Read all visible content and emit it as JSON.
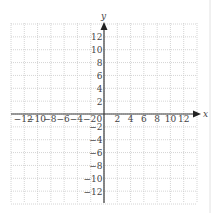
{
  "chart_data": {
    "type": "coordinate-grid",
    "title": "",
    "xlabel": "x",
    "ylabel": "y",
    "xlim": [
      -14,
      14
    ],
    "ylim": [
      -14,
      14
    ],
    "grid": true,
    "grid_step": 2,
    "x_ticks": [
      -12,
      -10,
      -8,
      -6,
      -4,
      -2,
      0,
      2,
      4,
      6,
      8,
      10,
      12
    ],
    "y_ticks": [
      -12,
      -10,
      -8,
      -6,
      -4,
      -2,
      2,
      4,
      6,
      8,
      10,
      12
    ],
    "x_tick_labels": [
      "−12",
      "−10",
      "−8",
      "−6",
      "−4",
      "−2",
      "0",
      "2",
      "4",
      "6",
      "8",
      "10",
      "12"
    ],
    "y_tick_labels": [
      "−12",
      "−10",
      "−8",
      "−6",
      "−4",
      "−2",
      "2",
      "4",
      "6",
      "8",
      "10",
      "12"
    ],
    "series": []
  },
  "axes": {
    "x_label": "x",
    "y_label": "y",
    "origin_label": "0"
  },
  "colors": {
    "grid": "#c9c9c9",
    "axis": "#3a3a3a",
    "text": "#444444",
    "background": "#ffffff"
  }
}
